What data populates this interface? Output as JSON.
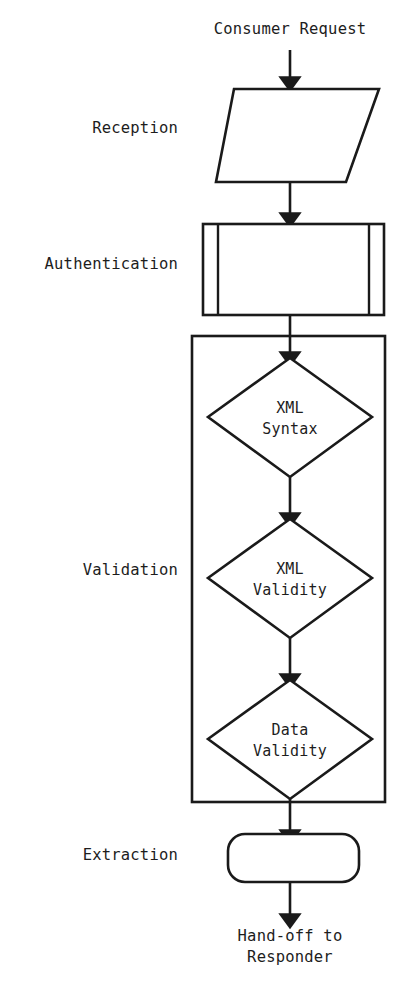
{
  "diagram": {
    "title_caption": "Consumer Request",
    "end_caption_line1": "Hand-off to",
    "end_caption_line2": "Responder",
    "stage_labels": [
      {
        "id": "reception",
        "text": "Reception"
      },
      {
        "id": "authentication",
        "text": "Authentication"
      },
      {
        "id": "validation",
        "text": "Validation"
      },
      {
        "id": "extraction",
        "text": "Extraction"
      }
    ],
    "nodes": [
      {
        "id": "reception-node",
        "shape": "parallelogram",
        "stage": "Reception",
        "line1": "",
        "line2": ""
      },
      {
        "id": "authentication-node",
        "shape": "predefined-process",
        "stage": "Authentication",
        "line1": "",
        "line2": ""
      },
      {
        "id": "xml-syntax-node",
        "shape": "diamond",
        "stage": "Validation",
        "line1": "XML",
        "line2": "Syntax"
      },
      {
        "id": "xml-validity-node",
        "shape": "diamond",
        "stage": "Validation",
        "line1": "XML",
        "line2": "Validity"
      },
      {
        "id": "data-validity-node",
        "shape": "diamond",
        "stage": "Validation",
        "line1": "Data",
        "line2": "Validity"
      },
      {
        "id": "extraction-node",
        "shape": "rounded-rectangle",
        "stage": "Extraction",
        "line1": "",
        "line2": ""
      }
    ],
    "colors": {
      "stroke": "#1a1a1a",
      "fill": "#ffffff",
      "text": "#1d1d1d",
      "background": "#ffffff"
    }
  }
}
